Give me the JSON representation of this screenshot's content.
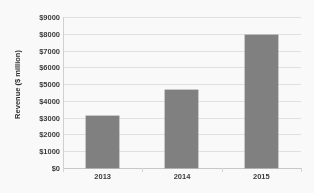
{
  "chart_data": {
    "type": "bar",
    "title": "",
    "xlabel": "",
    "ylabel": "Revenue ($ million)",
    "categories": [
      "2013",
      "2014",
      "2015"
    ],
    "values": [
      3100,
      4650,
      7900
    ],
    "ylim": [
      0,
      9000
    ],
    "ytick_step": 1000,
    "ytick_labels": [
      "$0",
      "$1000",
      "$2000",
      "$3000",
      "$4000",
      "$5000",
      "$6000",
      "$7000",
      "$8000",
      "$9000"
    ],
    "ytick_values": [
      0,
      1000,
      2000,
      3000,
      4000,
      5000,
      6000,
      7000,
      8000,
      9000
    ],
    "grid": true,
    "legend": false,
    "series": [
      {
        "name": "Revenue",
        "values": [
          3100,
          4650,
          7900
        ],
        "color": "#808080"
      }
    ],
    "colors": {
      "bar": "#808080",
      "gridline": "#e3e3e3",
      "axis": "#c9c9c9",
      "text": "#3a3a3a",
      "background": "#fdfdfd"
    }
  }
}
